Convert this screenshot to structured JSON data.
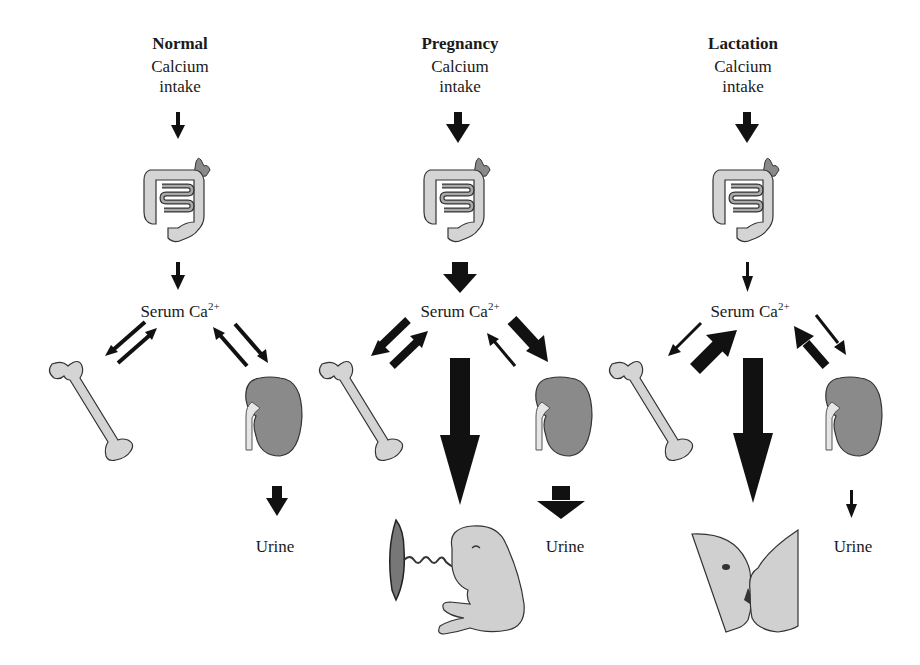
{
  "columns": [
    {
      "title": "Normal",
      "intake_line1": "Calcium",
      "intake_line2": "intake",
      "serum_label": "Serum Ca",
      "serum_sup": "2+",
      "urine_label": "Urine",
      "offspring": "none"
    },
    {
      "title": "Pregnancy",
      "intake_line1": "Calcium",
      "intake_line2": "intake",
      "serum_label": "Serum Ca",
      "serum_sup": "2+",
      "urine_label": "Urine",
      "offspring": "fetus with placenta"
    },
    {
      "title": "Lactation",
      "intake_line1": "Calcium",
      "intake_line2": "intake",
      "serum_label": "Serum Ca",
      "serum_sup": "2+",
      "urine_label": "Urine",
      "offspring": "breastfeeding infant"
    }
  ],
  "colors": {
    "arrow": "#111111",
    "organ_light": "#d4d4d4",
    "organ_dark": "#8a8a8a",
    "outline": "#333333"
  }
}
